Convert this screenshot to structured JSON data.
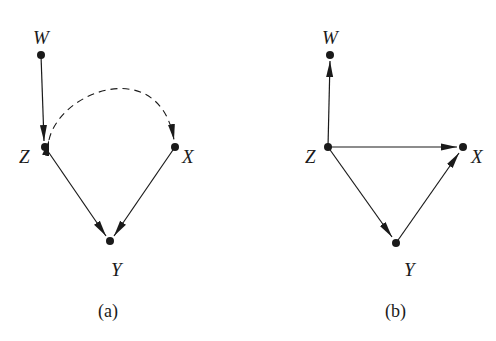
{
  "figure": {
    "panels": [
      {
        "id": "a",
        "caption": "(a)",
        "nodes": [
          {
            "id": "W",
            "label": "W",
            "x": 41,
            "y": 55
          },
          {
            "id": "Z",
            "label": "Z",
            "x": 45,
            "y": 147
          },
          {
            "id": "X",
            "label": "X",
            "x": 175,
            "y": 147
          },
          {
            "id": "Y",
            "label": "Y",
            "x": 110,
            "y": 241
          }
        ],
        "edges": [
          {
            "from": "W",
            "to": "Z",
            "style": "solid",
            "directed": true
          },
          {
            "from": "Z",
            "to": "Y",
            "style": "solid",
            "directed": true
          },
          {
            "from": "X",
            "to": "Y",
            "style": "solid",
            "directed": true
          },
          {
            "from": "Z",
            "to": "X",
            "style": "dashed-curved",
            "directed": "bidirected"
          }
        ]
      },
      {
        "id": "b",
        "caption": "(b)",
        "nodes": [
          {
            "id": "W",
            "label": "W",
            "x": 330,
            "y": 55
          },
          {
            "id": "Z",
            "label": "Z",
            "x": 328,
            "y": 147
          },
          {
            "id": "X",
            "label": "X",
            "x": 463,
            "y": 147
          },
          {
            "id": "Y",
            "label": "Y",
            "x": 396,
            "y": 243
          }
        ],
        "edges": [
          {
            "from": "Z",
            "to": "W",
            "style": "solid",
            "directed": true
          },
          {
            "from": "Z",
            "to": "X",
            "style": "solid",
            "directed": true
          },
          {
            "from": "Z",
            "to": "Y",
            "style": "solid",
            "directed": true
          },
          {
            "from": "Y",
            "to": "X",
            "style": "solid",
            "directed": true
          }
        ]
      }
    ],
    "colors": {
      "ink": "#1a1a1a",
      "background": "#ffffff"
    }
  }
}
